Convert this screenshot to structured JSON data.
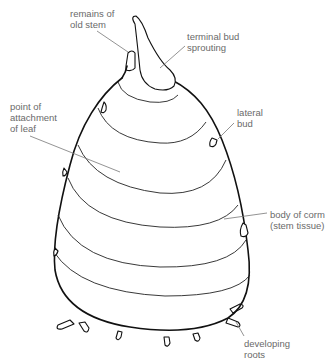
{
  "diagram": {
    "subject": "corm",
    "labels": [
      {
        "id": "remains-of-old-stem",
        "text": "remains of\nold stem",
        "x": 70,
        "y": 8
      },
      {
        "id": "terminal-bud-sprouting",
        "text": "terminal bud\nsprouting",
        "x": 187,
        "y": 31
      },
      {
        "id": "point-of-attachment-of-leaf",
        "text": "point of\nattachment\nof leaf",
        "x": 10,
        "y": 101
      },
      {
        "id": "lateral-bud",
        "text": "lateral\nbud",
        "x": 237,
        "y": 107
      },
      {
        "id": "body-of-corm",
        "text": "body of corm\n(stem tissue)",
        "x": 270,
        "y": 209
      },
      {
        "id": "developing-roots",
        "text": "developing\nroots",
        "x": 244,
        "y": 338
      }
    ],
    "line_color": "#111111",
    "label_color": "#6a6a6a"
  }
}
